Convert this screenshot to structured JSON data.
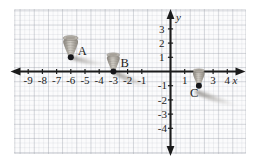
{
  "figure": {
    "type": "coordinate-plane",
    "axes": {
      "x_label": "x",
      "y_label": "y",
      "x_ticks": [
        "-9",
        "-8",
        "-7",
        "-6",
        "-5",
        "-4",
        "-3",
        "-2",
        "-1",
        "1",
        "2",
        "3",
        "4"
      ],
      "y_ticks": [
        "3",
        "2",
        "1",
        "-1",
        "-2",
        "-3",
        "-4"
      ],
      "x_min": -10,
      "x_max": 5,
      "y_min": -4.8,
      "y_max": 3.7,
      "grid": true,
      "arrows": [
        "left",
        "right",
        "up",
        "down"
      ]
    },
    "points": [
      {
        "label": "A",
        "x": -6,
        "y": 1,
        "label_dx": 7,
        "label_dy": -2
      },
      {
        "label": "B",
        "x": -3,
        "y": 0,
        "label_dx": 7,
        "label_dy": -5
      },
      {
        "label": "C",
        "x": 2,
        "y": -1,
        "label_dx": -9,
        "label_dy": 11
      }
    ],
    "colors": {
      "axis": "#1b1b1b",
      "grid_major": "#969baa",
      "grid_minor": "#bec2ca",
      "tornado_body": "#a9a49c",
      "tornado_shadow": "#8d8880",
      "debris_trail": "#b3b0ad",
      "point_dot": "#16161a",
      "plate_background": "#fbfbfc"
    }
  }
}
